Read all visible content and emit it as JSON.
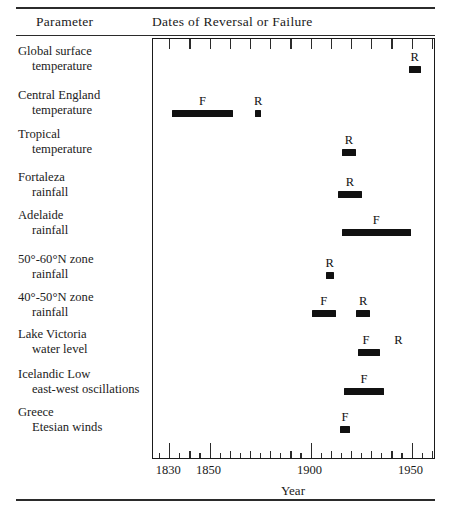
{
  "header": {
    "param_title": "Parameter",
    "dates_title": "Dates of Reversal or Failure"
  },
  "axis": {
    "title": "Year",
    "x_min": 1822,
    "x_max": 1962,
    "px_per_year": 2.02,
    "plot_left_px": 152,
    "plot_width_px": 283,
    "tick_labels": [
      "1830",
      "1850",
      "1900",
      "1950"
    ],
    "tick_label_years": [
      1830,
      1850,
      1900,
      1950
    ],
    "minor_tick_years": [
      1830,
      1840,
      1850,
      1860,
      1870,
      1880,
      1890,
      1900,
      1910,
      1920,
      1930,
      1940,
      1950,
      1960
    ],
    "top_tick_years": [
      1830,
      1840,
      1850,
      1860,
      1870,
      1880,
      1890,
      1900,
      1910,
      1920,
      1930,
      1940,
      1950,
      1960
    ]
  },
  "chart_data": {
    "type": "bar",
    "title": "Dates of Reversal or Failure",
    "xlabel": "Year",
    "ylabel": "Parameter",
    "xlim": [
      1822,
      1962
    ],
    "grid": false,
    "legend": null,
    "categories": [
      "Global surface temperature",
      "Central England temperature",
      "Tropical temperature",
      "Fortaleza rainfall",
      "Adelaide rainfall",
      "50°-60°N zone rainfall",
      "40°-50°N zone rainfall",
      "Lake Victoria water level",
      "Icelandic Low east-west oscillations",
      "Greece Etesian winds"
    ],
    "rows": [
      {
        "line1": "Global surface",
        "line2": "temperature",
        "events": [
          {
            "label": "R",
            "start_year": 1949,
            "end_year": 1955
          }
        ]
      },
      {
        "line1": "Central England",
        "line2": "temperature",
        "events": [
          {
            "label": "F",
            "start_year": 1832,
            "end_year": 1862
          },
          {
            "label": "R",
            "start_year": 1873,
            "end_year": 1876
          }
        ]
      },
      {
        "line1": "Tropical",
        "line2": "temperature",
        "events": [
          {
            "label": "R",
            "start_year": 1916,
            "end_year": 1923
          }
        ]
      },
      {
        "line1": "Fortaleza",
        "line2": "rainfall",
        "events": [
          {
            "label": "R",
            "start_year": 1914,
            "end_year": 1926
          }
        ]
      },
      {
        "line1": "Adelaide",
        "line2": "rainfall",
        "events": [
          {
            "label": "F",
            "start_year": 1916,
            "end_year": 1950
          }
        ]
      },
      {
        "line1": "50°-60°N zone",
        "line2": "rainfall",
        "events": [
          {
            "label": "R",
            "start_year": 1908,
            "end_year": 1912
          }
        ]
      },
      {
        "line1": "40°-50°N zone",
        "line2": "rainfall",
        "events": [
          {
            "label": "F",
            "start_year": 1901,
            "end_year": 1913
          },
          {
            "label": "R",
            "start_year": 1923,
            "end_year": 1930
          }
        ]
      },
      {
        "line1": "Lake Victoria",
        "line2": "water level",
        "events": [
          {
            "label": "F",
            "start_year": 1924,
            "end_year": 1935,
            "label2": "R",
            "label2_year": 1944
          }
        ]
      },
      {
        "line1": "Icelandic Low",
        "line2": "east-west oscillations",
        "events": [
          {
            "label": "F",
            "start_year": 1917,
            "end_year": 1937
          }
        ]
      },
      {
        "line1": "Greece",
        "line2": "Etesian winds",
        "events": [
          {
            "label": "F",
            "start_year": 1915,
            "end_year": 1920
          }
        ]
      }
    ]
  },
  "colors": {
    "bar": "#111111",
    "rule": "#2b2b2b",
    "text": "#1a1a1a"
  }
}
